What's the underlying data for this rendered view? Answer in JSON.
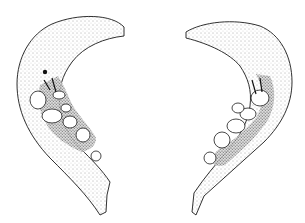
{
  "image": {
    "kind": "scientific-illustration",
    "subject": "paired mandible fragments with teeth",
    "background": "#ffffff",
    "ink": "#1a1a1a",
    "specimens": [
      {
        "side": "left",
        "x": 0,
        "y": 0,
        "w": 152,
        "h": 223
      },
      {
        "side": "right",
        "x": 152,
        "y": 0,
        "w": 153,
        "h": 223
      }
    ]
  }
}
